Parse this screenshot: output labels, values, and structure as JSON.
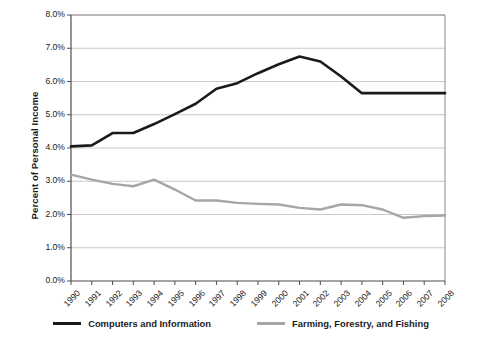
{
  "chart_data": {
    "type": "line",
    "title": "",
    "xlabel": "",
    "ylabel": "Percent of Personal Income",
    "ylim": [
      0,
      8
    ],
    "ytick_labels": [
      "0.0%",
      "1.0%",
      "2.0%",
      "3.0%",
      "4.0%",
      "5.0%",
      "6.0%",
      "7.0%",
      "8.0%"
    ],
    "ytick_values": [
      0,
      1,
      2,
      3,
      4,
      5,
      6,
      7,
      8
    ],
    "grid": "horizontal",
    "legend_position": "bottom",
    "x": [
      1990,
      1991,
      1992,
      1993,
      1994,
      1995,
      1996,
      1997,
      1998,
      1999,
      2000,
      2001,
      2002,
      2003,
      2004,
      2005,
      2006,
      2007,
      2008
    ],
    "categories": [
      "1990",
      "1991",
      "1992",
      "1993",
      "1994",
      "1995",
      "1996",
      "1997",
      "1998",
      "1999",
      "2000",
      "2001",
      "2002",
      "2003",
      "2004",
      "2005",
      "2006",
      "2007",
      "2008"
    ],
    "series": [
      {
        "name": "Computers and Information",
        "color": "#1a1a1a",
        "values": [
          4.05,
          4.08,
          4.45,
          4.45,
          4.72,
          5.02,
          5.33,
          5.78,
          5.95,
          6.25,
          6.52,
          6.75,
          6.6,
          6.15,
          5.65,
          5.65,
          5.65,
          5.65,
          5.65
        ]
      },
      {
        "name": "Farming, Forestry, and Fishing",
        "color": "#a6a6a6",
        "values": [
          3.2,
          3.05,
          2.92,
          2.85,
          3.05,
          2.75,
          2.42,
          2.42,
          2.35,
          2.32,
          2.3,
          2.2,
          2.15,
          2.3,
          2.28,
          2.15,
          1.9,
          1.95,
          1.97
        ]
      }
    ]
  },
  "legend": {
    "items": [
      {
        "label": "Computers and Information",
        "color": "#1a1a1a"
      },
      {
        "label": "Farming, Forestry, and Fishing",
        "color": "#a6a6a6"
      }
    ]
  }
}
